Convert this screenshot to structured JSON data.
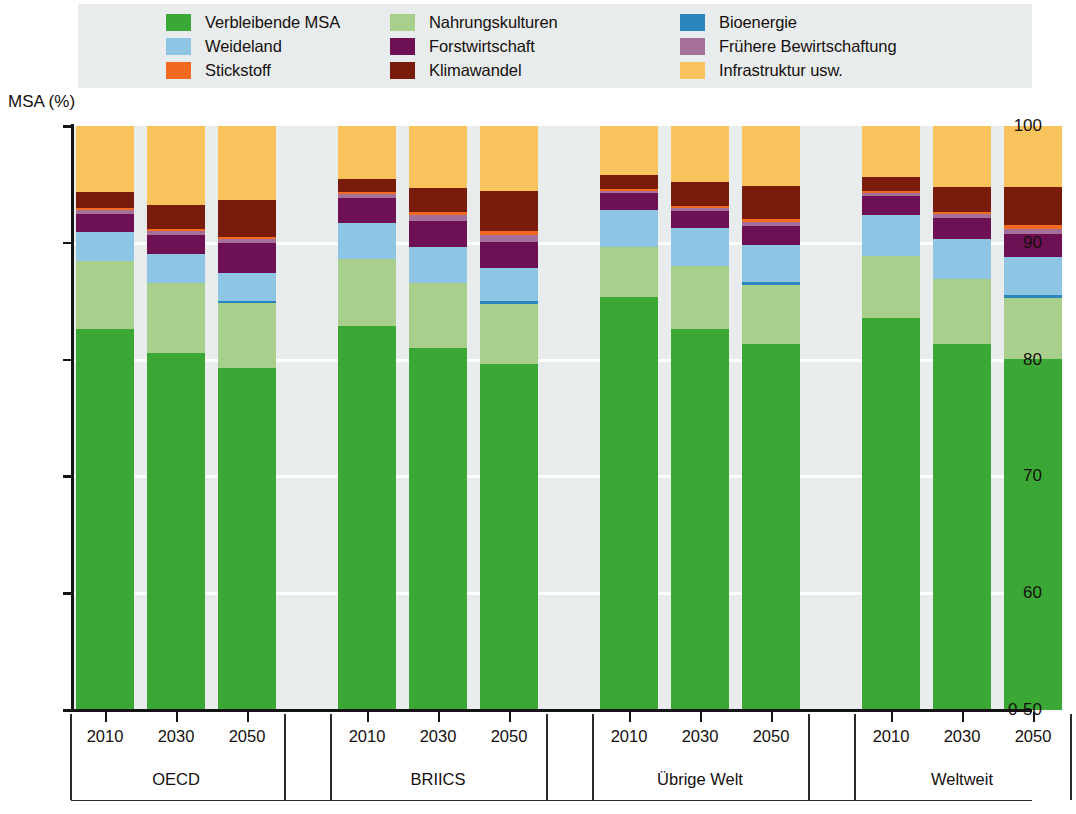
{
  "axis": {
    "y_title": "MSA (%)",
    "y_ticks": [
      "100",
      "90",
      "80",
      "70",
      "60",
      "0-50"
    ]
  },
  "legend": {
    "items": [
      {
        "label": "Verbleibende MSA",
        "color": "#3ba734",
        "key": "remaining_msa"
      },
      {
        "label": "Nahrungskulturen",
        "color": "#a9cf8c",
        "key": "food_crops"
      },
      {
        "label": "Bioenergie",
        "color": "#2b86bd",
        "key": "bioenergy"
      },
      {
        "label": "Weideland",
        "color": "#8ec4e4",
        "key": "pasture"
      },
      {
        "label": "Forstwirtschaft",
        "color": "#6d1054",
        "key": "forestry"
      },
      {
        "label": "Frühere Bewirtschaftung",
        "color": "#a4709a",
        "key": "former_management"
      },
      {
        "label": "Stickstoff",
        "color": "#f26a21",
        "key": "nitrogen"
      },
      {
        "label": "Klimawandel",
        "color": "#7a1c0c",
        "key": "climate_change"
      },
      {
        "label": "Infrastruktur usw.",
        "color": "#f8c35c",
        "key": "infrastructure"
      }
    ]
  },
  "chart_data": {
    "type": "bar",
    "title": "",
    "xlabel": "",
    "ylabel": "MSA (%)",
    "ylim": [
      50,
      100
    ],
    "y_ticks": [
      50,
      60,
      70,
      80,
      90,
      100
    ],
    "grid": true,
    "stacked": true,
    "legend_position": "top",
    "groups": [
      "OECD",
      "BRIICS",
      "Übrige Welt",
      "Weltweit"
    ],
    "years": [
      "2010",
      "2030",
      "2050"
    ],
    "series_order": [
      "remaining_msa",
      "food_crops",
      "bioenergy",
      "pasture",
      "forestry",
      "former_management",
      "nitrogen",
      "climate_change",
      "infrastructure"
    ],
    "series": [
      {
        "name": "Verbleibende MSA",
        "color": "#3ba734",
        "values": [
          65.2,
          61.2,
          58.6,
          65.7,
          62.0,
          59.3,
          70.8,
          65.2,
          62.7,
          67.2,
          62.7,
          60.1
        ]
      },
      {
        "name": "Nahrungskulturen",
        "color": "#a9cf8c",
        "values": [
          11.6,
          11.9,
          11.1,
          11.6,
          11.1,
          10.3,
          8.4,
          10.8,
          10.0,
          10.5,
          11.1,
          10.5
        ]
      },
      {
        "name": "Bioenergie",
        "color": "#2b86bd",
        "values": [
          0.0,
          0.0,
          0.4,
          0.0,
          0.0,
          0.4,
          0.0,
          0.0,
          0.5,
          0.0,
          0.0,
          0.5
        ]
      },
      {
        "name": "Weideland",
        "color": "#8ec4e4",
        "values": [
          5.1,
          4.9,
          4.7,
          6.1,
          6.2,
          5.7,
          6.5,
          6.5,
          6.5,
          7.0,
          6.9,
          6.5
        ]
      },
      {
        "name": "Forstwirtschaft",
        "color": "#6d1054",
        "values": [
          3.1,
          3.4,
          5.2,
          4.2,
          4.4,
          4.5,
          2.8,
          2.9,
          3.2,
          3.3,
          3.5,
          3.9
        ]
      },
      {
        "name": "Frühere Bewirtschaftung",
        "color": "#a4709a",
        "values": [
          0.6,
          0.6,
          0.6,
          0.7,
          1.0,
          1.1,
          0.4,
          0.5,
          0.6,
          0.5,
          0.7,
          0.9
        ]
      },
      {
        "name": "Stickstoff",
        "color": "#f26a21",
        "values": [
          0.4,
          0.4,
          0.4,
          0.4,
          0.5,
          0.7,
          0.3,
          0.4,
          0.5,
          0.3,
          0.4,
          0.6
        ]
      },
      {
        "name": "Klimawandel",
        "color": "#7a1c0c",
        "values": [
          2.7,
          4.1,
          6.3,
          2.3,
          4.2,
          6.8,
          2.4,
          4.1,
          5.7,
          2.4,
          4.2,
          6.5
        ]
      },
      {
        "name": "Infrastruktur usw.",
        "color": "#f8c35c",
        "values": [
          11.3,
          13.5,
          12.7,
          9.0,
          10.6,
          11.2,
          8.4,
          9.6,
          10.3,
          8.8,
          10.5,
          10.5
        ]
      }
    ],
    "bar_totals": [
      100,
      100,
      100,
      100,
      100,
      100,
      100,
      100,
      100,
      100,
      100,
      100
    ],
    "stack_tops": {
      "note": "cumulative upper boundary (MSA %) of each segment, per bar",
      "OECD_2010": {
        "remaining_msa": 65.2,
        "food_crops": 76.8,
        "bioenergy": 76.8,
        "pasture": 81.9,
        "forestry": 85.0,
        "former_management": 85.6,
        "nitrogen": 86.0,
        "climate_change": 88.7,
        "infrastructure": 100
      },
      "OECD_2030": {
        "remaining_msa": 61.2,
        "food_crops": 73.1,
        "bioenergy": 73.1,
        "pasture": 78.0,
        "forestry": 81.4,
        "former_management": 82.0,
        "nitrogen": 82.4,
        "climate_change": 86.5,
        "infrastructure": 100
      },
      "OECD_2050": {
        "remaining_msa": 58.6,
        "food_crops": 69.7,
        "bioenergy": 70.1,
        "pasture": 74.8,
        "forestry": 80.0,
        "former_management": 80.6,
        "nitrogen": 81.0,
        "climate_change": 87.3,
        "infrastructure": 100
      },
      "BRIICS_2010": {
        "remaining_msa": 65.7,
        "food_crops": 77.3,
        "bioenergy": 77.3,
        "pasture": 83.4,
        "forestry": 87.6,
        "former_management": 88.3,
        "nitrogen": 88.7,
        "climate_change": 91.0,
        "infrastructure": 100
      },
      "BRIICS_2030": {
        "remaining_msa": 62.0,
        "food_crops": 73.1,
        "bioenergy": 73.1,
        "pasture": 79.3,
        "forestry": 83.7,
        "former_management": 84.7,
        "nitrogen": 85.2,
        "climate_change": 89.4,
        "infrastructure": 100
      },
      "BRIICS_2050": {
        "remaining_msa": 59.3,
        "food_crops": 69.6,
        "bioenergy": 70.0,
        "pasture": 75.7,
        "forestry": 80.2,
        "former_management": 81.3,
        "nitrogen": 82.0,
        "climate_change": 88.8,
        "infrastructure": 100
      },
      "UebrigeWelt_2010": {
        "remaining_msa": 70.8,
        "food_crops": 79.2,
        "bioenergy": 79.2,
        "pasture": 85.7,
        "forestry": 88.5,
        "former_management": 88.9,
        "nitrogen": 89.2,
        "climate_change": 91.6,
        "infrastructure": 100
      },
      "UebrigeWelt_2030": {
        "remaining_msa": 65.2,
        "food_crops": 76.0,
        "bioenergy": 76.0,
        "pasture": 82.5,
        "forestry": 85.4,
        "former_management": 85.9,
        "nitrogen": 86.3,
        "climate_change": 90.4,
        "infrastructure": 100
      },
      "UebrigeWelt_2050": {
        "remaining_msa": 62.7,
        "food_crops": 72.7,
        "bioenergy": 73.2,
        "pasture": 79.7,
        "forestry": 82.9,
        "former_management": 83.5,
        "nitrogen": 84.0,
        "climate_change": 89.7,
        "infrastructure": 100
      },
      "Weltweit_2010": {
        "remaining_msa": 67.2,
        "food_crops": 77.7,
        "bioenergy": 77.7,
        "pasture": 84.7,
        "forestry": 88.0,
        "former_management": 88.5,
        "nitrogen": 88.8,
        "climate_change": 91.2,
        "infrastructure": 100
      },
      "Weltweit_2030": {
        "remaining_msa": 62.7,
        "food_crops": 73.8,
        "bioenergy": 73.8,
        "pasture": 80.7,
        "forestry": 84.2,
        "former_management": 84.9,
        "nitrogen": 85.3,
        "climate_change": 89.5,
        "infrastructure": 100
      },
      "Weltweit_2050": {
        "remaining_msa": 60.1,
        "food_crops": 70.6,
        "bioenergy": 71.1,
        "pasture": 77.6,
        "forestry": 81.5,
        "former_management": 82.4,
        "nitrogen": 83.0,
        "climate_change": 89.5,
        "infrastructure": 100
      }
    }
  }
}
